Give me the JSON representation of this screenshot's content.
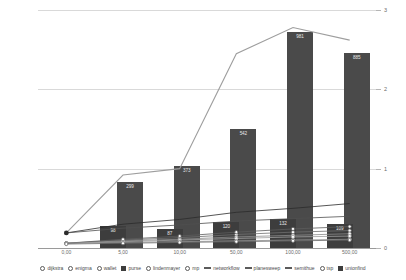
{
  "chart_data": {
    "type": "bar",
    "title": "",
    "subtitle": "",
    "xlabel": "",
    "ylabel": "",
    "categories": [
      "0,00",
      "5,00",
      "10,00",
      "50,00",
      "100,00",
      "500,00"
    ],
    "ylim": [
      0,
      3
    ],
    "yticks": [
      "0",
      "1",
      "2",
      "3"
    ],
    "grid": true,
    "legend_position": "bottom",
    "bar_series": {
      "name": "unionfind",
      "values": [
        0,
        98,
        87,
        120,
        132,
        109
      ],
      "labels": [
        "",
        "98",
        "87",
        "120",
        "132",
        "109"
      ],
      "color": "#3d3d3d"
    },
    "bar_series_tall": {
      "name": "purse",
      "values": [
        0,
        299,
        373,
        542,
        981,
        885
      ],
      "labels": [
        "",
        "299",
        "373",
        "542",
        "981",
        "885"
      ],
      "color": "#4a4a4a"
    },
    "series": [
      {
        "name": "dijkstra",
        "values": [
          0.06,
          0.1,
          0.13,
          0.17,
          0.2,
          0.22
        ],
        "color": "#6f6f6f",
        "marker": "circle"
      },
      {
        "name": "enigma",
        "values": [
          0.06,
          0.09,
          0.11,
          0.14,
          0.16,
          0.18
        ],
        "color": "#8a8a8a",
        "marker": "circle"
      },
      {
        "name": "wallet",
        "values": [
          0.06,
          0.08,
          0.1,
          0.12,
          0.14,
          0.15
        ],
        "color": "#a0a0a0",
        "marker": "circle"
      },
      {
        "name": "purse",
        "values": [
          0,
          0,
          0,
          0,
          0,
          0
        ],
        "color": "#3d3d3d",
        "marker": "square"
      },
      {
        "name": "lindenmayer",
        "values": [
          0.06,
          0.11,
          0.15,
          0.2,
          0.24,
          0.27
        ],
        "color": "#5c5c5c",
        "marker": "circle"
      },
      {
        "name": "mp",
        "values": [
          0.06,
          0.07,
          0.08,
          0.09,
          0.1,
          0.11
        ],
        "color": "#989898",
        "marker": "circle"
      },
      {
        "name": "networkflow",
        "values": [
          0.19,
          0.3,
          0.36,
          0.45,
          0.5,
          0.56
        ],
        "color": "#2b2b2b",
        "marker": "line"
      },
      {
        "name": "planesweep",
        "values": [
          0.19,
          0.25,
          0.29,
          0.34,
          0.37,
          0.4
        ],
        "color": "#4f4f4f",
        "marker": "line"
      },
      {
        "name": "semithue",
        "values": [
          0.19,
          0.92,
          1.0,
          2.45,
          2.78,
          2.62
        ],
        "color": "#9e9e9e",
        "marker": "line"
      },
      {
        "name": "tsp",
        "values": [
          0.05,
          0.06,
          0.07,
          0.08,
          0.09,
          0.1
        ],
        "color": "#6b6b6b",
        "marker": "circle"
      },
      {
        "name": "unionfind",
        "values": [
          0,
          0,
          0,
          0,
          0,
          0
        ],
        "color": "#3d3d3d",
        "marker": "square"
      }
    ]
  },
  "legend": {
    "items": [
      {
        "label": "dijkstra",
        "marker": "circle"
      },
      {
        "label": "enigma",
        "marker": "circle"
      },
      {
        "label": "wallet",
        "marker": "circle"
      },
      {
        "label": "purse",
        "marker": "square"
      },
      {
        "label": "lindenmayer",
        "marker": "circle"
      },
      {
        "label": "mp",
        "marker": "circle"
      },
      {
        "label": "networkflow",
        "marker": "line"
      },
      {
        "label": "planesweep",
        "marker": "line"
      },
      {
        "label": "semithue",
        "marker": "line"
      },
      {
        "label": "tsp",
        "marker": "circle"
      },
      {
        "label": "unionfind",
        "marker": "square"
      }
    ]
  },
  "colors": {
    "bar": "#3d3d3d",
    "grid": "#d9d9d9",
    "axis": "#9a9a9a",
    "highlight_line": "#9e9e9e",
    "text": "#6b6b6b"
  }
}
